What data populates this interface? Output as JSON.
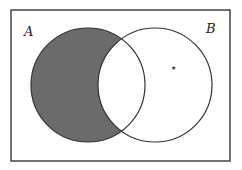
{
  "diagram": {
    "type": "venn",
    "universe": {
      "x": 11,
      "y": 10,
      "width": 219,
      "height": 151,
      "stroke": "#444444"
    },
    "sets": [
      {
        "label": "A",
        "cx": 88,
        "cy": 85,
        "r": 57,
        "label_x": 24,
        "label_y": 36
      },
      {
        "label": "B",
        "cx": 155,
        "cy": 85,
        "r": 57,
        "label_x": 206,
        "label_y": 33
      }
    ],
    "shaded_region": "A minus B",
    "shade_color": "#6b6b6b",
    "outline_color": "#333333",
    "marker": {
      "symbol": "★",
      "x": 174,
      "y": 67
    }
  }
}
